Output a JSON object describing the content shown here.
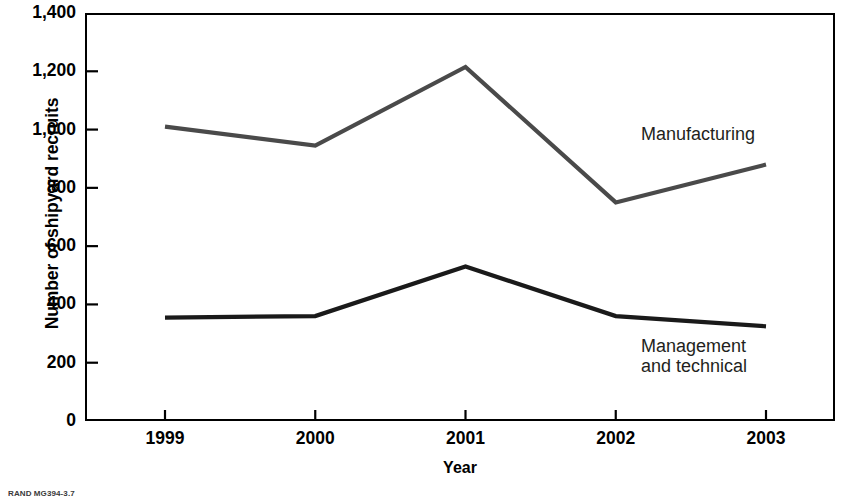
{
  "chart_data": {
    "type": "line",
    "title": "",
    "xlabel": "Year",
    "ylabel": "Number of shipyard recruits",
    "categories": [
      "1999",
      "2000",
      "2001",
      "2002",
      "2003"
    ],
    "x": [
      1999,
      2000,
      2001,
      2002,
      2003
    ],
    "ylim": [
      0,
      1400
    ],
    "yticks": [
      0,
      200,
      400,
      600,
      800,
      1000,
      1200,
      1400
    ],
    "ytick_labels": [
      "0",
      "200",
      "400",
      "600",
      "800",
      "1,000",
      "1,200",
      "1,400"
    ],
    "grid": false,
    "legend_position": "inline-annotations",
    "series": [
      {
        "name": "Manufacturing",
        "values": [
          1010,
          945,
          1215,
          750,
          880
        ],
        "color": "#4a4a4a"
      },
      {
        "name": "Management and technical",
        "values": [
          355,
          360,
          530,
          360,
          325
        ],
        "color": "#1a1a1a"
      }
    ],
    "annotations": [
      {
        "name": "manufacturing",
        "text": "Manufacturing"
      },
      {
        "name": "management",
        "text": "Management\nand technical"
      }
    ]
  },
  "axes": {
    "y_title": "Number of shipyard recruits",
    "x_title": "Year"
  },
  "source_note": "RAND MG394-3.7"
}
